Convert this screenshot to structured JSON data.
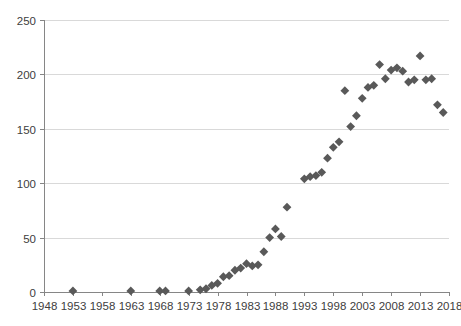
{
  "chart_data": {
    "type": "scatter",
    "title": "",
    "xlabel": "",
    "ylabel": "",
    "xlim": [
      1948,
      2018
    ],
    "ylim": [
      0,
      250
    ],
    "xticks": [
      1948,
      1953,
      1958,
      1963,
      1968,
      1973,
      1978,
      1983,
      1988,
      1993,
      1998,
      2003,
      2008,
      2013,
      2018
    ],
    "yticks": [
      0,
      50,
      100,
      150,
      200,
      250
    ],
    "grid": "horizontal",
    "legend": "none",
    "marker": "diamond",
    "marker_color": "#595959",
    "series": [
      {
        "name": "series-1",
        "points": [
          [
            1953,
            1
          ],
          [
            1963,
            1
          ],
          [
            1968,
            1
          ],
          [
            1969,
            1
          ],
          [
            1973,
            1
          ],
          [
            1975,
            2
          ],
          [
            1976,
            3
          ],
          [
            1977,
            6
          ],
          [
            1978,
            8
          ],
          [
            1979,
            14
          ],
          [
            1980,
            15
          ],
          [
            1981,
            20
          ],
          [
            1982,
            22
          ],
          [
            1983,
            26
          ],
          [
            1984,
            24
          ],
          [
            1985,
            25
          ],
          [
            1986,
            37
          ],
          [
            1987,
            50
          ],
          [
            1988,
            58
          ],
          [
            1989,
            51
          ],
          [
            1990,
            78
          ],
          [
            1993,
            104
          ],
          [
            1994,
            106
          ],
          [
            1995,
            107
          ],
          [
            1996,
            110
          ],
          [
            1997,
            123
          ],
          [
            1998,
            133
          ],
          [
            1999,
            138
          ],
          [
            2000,
            185
          ],
          [
            2001,
            152
          ],
          [
            2002,
            162
          ],
          [
            2003,
            178
          ],
          [
            2004,
            188
          ],
          [
            2005,
            190
          ],
          [
            2006,
            209
          ],
          [
            2007,
            196
          ],
          [
            2008,
            204
          ],
          [
            2009,
            206
          ],
          [
            2010,
            203
          ],
          [
            2011,
            193
          ],
          [
            2012,
            195
          ],
          [
            2013,
            217
          ],
          [
            2014,
            195
          ],
          [
            2015,
            196
          ],
          [
            2016,
            172
          ],
          [
            2017,
            165
          ]
        ]
      }
    ]
  },
  "axes": {
    "y_tick_labels": [
      "250",
      "200",
      "150",
      "100",
      "50",
      "0"
    ],
    "x_tick_labels": [
      "1948",
      "1953",
      "1958",
      "1963",
      "1968",
      "1973",
      "1978",
      "1983",
      "1988",
      "1993",
      "1998",
      "2003",
      "2008",
      "2013",
      "2018"
    ]
  }
}
